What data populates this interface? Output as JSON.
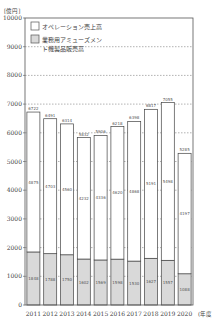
{
  "chart_data": {
    "type": "bar",
    "stacked": true,
    "title": "",
    "ylabel": "[億円]",
    "xlabel": "(年度)",
    "ylim": [
      0,
      10000
    ],
    "yticks": [
      0,
      1000,
      2000,
      3000,
      4000,
      5000,
      6000,
      7000,
      8000,
      9000,
      10000
    ],
    "ytick_labels": [
      "0",
      "1000",
      "2000",
      "3000",
      "4000",
      "5000",
      "6000",
      "7000",
      "8000",
      "9000",
      "10000"
    ],
    "grid": true,
    "legend_position": "top-left",
    "categories": [
      "2011",
      "2012",
      "2013",
      "2014",
      "2015",
      "2016",
      "2017",
      "2018",
      "2019",
      "2020"
    ],
    "series": [
      {
        "name": "業務用アミューズメント機製品販売高",
        "color": "#d9d9d9",
        "values": [
          1848,
          1788,
          1750,
          1602,
          1569,
          1598,
          1530,
          1627,
          1557,
          1088
        ]
      },
      {
        "name": "オペレーション売上高",
        "color": "#ffffff",
        "values": [
          4875,
          4703,
          4560,
          4232,
          4336,
          4620,
          4868,
          5191,
          5498,
          4197
        ]
      }
    ],
    "totals": [
      6722,
      6491,
      6314,
      5832,
      5906,
      6218,
      6398,
      6817,
      7055,
      5285
    ]
  }
}
